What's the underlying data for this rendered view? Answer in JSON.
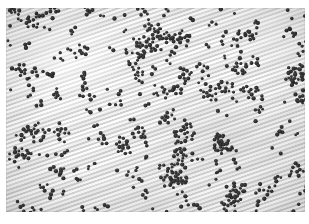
{
  "figure": {
    "kind": "photomicrograph",
    "caption": "",
    "width_px": 309,
    "height_px": 224
  },
  "plate": {
    "left_px": 6,
    "top_px": 8,
    "width_px": 299,
    "height_px": 204,
    "background_color": "#eaeaea",
    "paper_color": "#ffffff"
  },
  "texture": {
    "name": "diagonal-wavy-striations",
    "angle_deg": -19,
    "secondary_angle_deg": -22.5,
    "light_band_color": "#ffffff",
    "dark_band_color": "#c6c6c6",
    "period_px": 4
  },
  "cells": {
    "stain_color": "#2b2b2b",
    "halo_color": "#9a9a9a",
    "mean_diameter_px": 3.4,
    "count": 820,
    "arrangement": "clusters, diplo-pairs and short chains"
  },
  "vignette": {
    "edge_darkness": 0.13
  }
}
